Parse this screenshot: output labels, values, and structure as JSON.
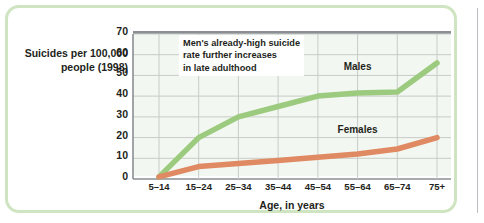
{
  "figure": {
    "y_axis_caption": "Suicides per\n100,000 people\n(1998)",
    "x_axis_title": "Age, in years",
    "annotation": "Men's already-high suicide\nrate further increases\nin late adulthood"
  },
  "chart_data": {
    "type": "line",
    "title": "",
    "xlabel": "Age, in years",
    "ylabel": "Suicides per 100,000 people (1998)",
    "categories": [
      "5–14",
      "15–24",
      "25–34",
      "35–44",
      "45–54",
      "55–64",
      "65–74",
      "75+"
    ],
    "ylim": [
      0,
      70
    ],
    "yticks": [
      0,
      10,
      20,
      30,
      40,
      50,
      60,
      70
    ],
    "grid": true,
    "legend_position": "inline-labels",
    "series": [
      {
        "name": "Males",
        "color": "#9ccb7f",
        "values": [
          1,
          20,
          30,
          35,
          40,
          41.5,
          42,
          56
        ]
      },
      {
        "name": "Females",
        "color": "#e08a63",
        "values": [
          1,
          6,
          7.5,
          9,
          10.5,
          12,
          14.5,
          20
        ]
      }
    ],
    "annotations": [
      {
        "text": "Men's already-high suicide rate further increases in late adulthood",
        "target": "Males"
      }
    ]
  }
}
